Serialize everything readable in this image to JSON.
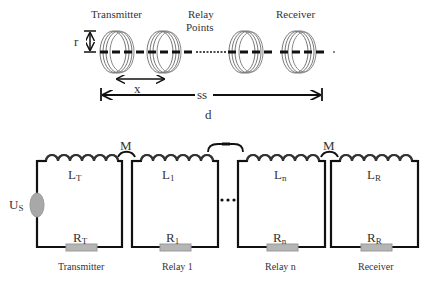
{
  "top_diagram": {
    "labels": {
      "transmitter": "Transmitter",
      "relay_points_line1": "Relay",
      "relay_points_line2": "Points",
      "receiver": "Receiver",
      "radius": "r",
      "spacing": "x",
      "span": "ss",
      "distance": "d"
    }
  },
  "circuit": {
    "mutual_label": "M",
    "ellipsis": "...",
    "loops": [
      {
        "name": "Transmitter",
        "inductor": "L",
        "inductor_sub": "T",
        "resistor": "R",
        "resistor_sub": "T",
        "has_source": true
      },
      {
        "name": "Relay 1",
        "inductor": "L",
        "inductor_sub": "1",
        "resistor": "R",
        "resistor_sub": "1",
        "has_source": false
      },
      {
        "name": "Relay n",
        "inductor": "L",
        "inductor_sub": "n",
        "resistor": "R",
        "resistor_sub": "n",
        "has_source": false
      },
      {
        "name": "Receiver",
        "inductor": "L",
        "inductor_sub": "R",
        "resistor": "R",
        "resistor_sub": "R",
        "has_source": false
      }
    ],
    "source": {
      "label": "U",
      "sub": "S"
    }
  },
  "colors": {
    "wire": "#111111",
    "coil": "#555555",
    "source_fill": "#a8a8a8",
    "resistor_fill": "#b5b5b5"
  }
}
